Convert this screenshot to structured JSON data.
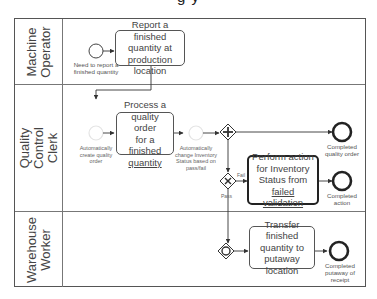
{
  "diagram": {
    "type": "bpmn-swimlane",
    "title_fragment": "g    y",
    "lanes": [
      {
        "id": "machine-operator",
        "label": "Machine\nOperator"
      },
      {
        "id": "quality-control-clerk",
        "label": "Quality\nControl\nClerk"
      },
      {
        "id": "warehouse-worker",
        "label": "Warehouse\nWorker"
      }
    ],
    "events": {
      "start": {
        "label": "Need to report a finished quantity"
      },
      "auto_create": {
        "label": "Automatically create quality order"
      },
      "auto_change": {
        "label": "Automatically change Inventory Status based on pass/fail"
      },
      "end_quality_order": {
        "label": "Completed quality order"
      },
      "end_action": {
        "label": "Completed action"
      },
      "end_putaway": {
        "label": "Completed putaway of receipt"
      }
    },
    "tasks": {
      "report": {
        "line1": "Report a finished",
        "line2": "quantity at",
        "line3": "production",
        "line4": "location"
      },
      "process": {
        "line1": "Process a",
        "line2": "quality order",
        "line3": "for a finished",
        "line4": "quantity"
      },
      "perform": {
        "line1": "Perform action",
        "line2": "for Inventory",
        "line3": "Status from",
        "line4": "failed validation"
      },
      "transfer": {
        "line1": "Transfer finished",
        "line2": "quantity to",
        "line3": "putaway location"
      }
    },
    "gateway_labels": {
      "fail": "Fail",
      "pass": "Pass"
    }
  }
}
